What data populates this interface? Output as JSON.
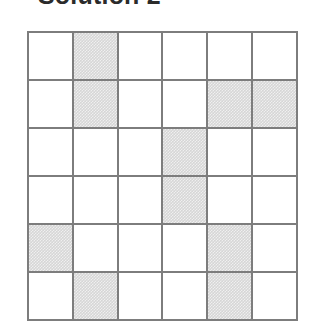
{
  "page": {
    "title": "Solution 2",
    "title_clipped_at_top": true
  },
  "colors": {
    "grid_line": "#7d7d7d",
    "cell_empty": "#ffffff",
    "cell_shaded": "#d6d6d6",
    "title_text": "#2b2b2b",
    "background": "#ffffff"
  },
  "chart_data": {
    "type": "heatmap",
    "title": "Solution 2",
    "xlabel": "",
    "ylabel": "",
    "rows": 6,
    "columns": 6,
    "legend": [
      {
        "key": "shaded",
        "value": 1,
        "label": "shaded"
      },
      {
        "key": "empty",
        "value": 0,
        "label": "empty"
      }
    ],
    "categories": [
      "1",
      "2",
      "3",
      "4",
      "5",
      "6"
    ],
    "row_labels": [
      "1",
      "2",
      "3",
      "4",
      "5",
      "6"
    ],
    "values": [
      [
        0,
        1,
        0,
        0,
        0,
        0
      ],
      [
        0,
        1,
        0,
        0,
        1,
        1
      ],
      [
        0,
        0,
        0,
        1,
        0,
        0
      ],
      [
        0,
        0,
        0,
        1,
        0,
        0
      ],
      [
        1,
        0,
        0,
        0,
        1,
        0
      ],
      [
        0,
        1,
        0,
        0,
        1,
        0
      ]
    ],
    "shaded_cells": [
      {
        "row": 1,
        "col": 2
      },
      {
        "row": 2,
        "col": 2
      },
      {
        "row": 2,
        "col": 5
      },
      {
        "row": 2,
        "col": 6
      },
      {
        "row": 3,
        "col": 4
      },
      {
        "row": 4,
        "col": 4
      },
      {
        "row": 5,
        "col": 1
      },
      {
        "row": 5,
        "col": 5
      },
      {
        "row": 6,
        "col": 2
      },
      {
        "row": 6,
        "col": 5
      }
    ],
    "shaded_count": 10,
    "empty_count": 26,
    "grid": true,
    "legend_position": "none"
  }
}
